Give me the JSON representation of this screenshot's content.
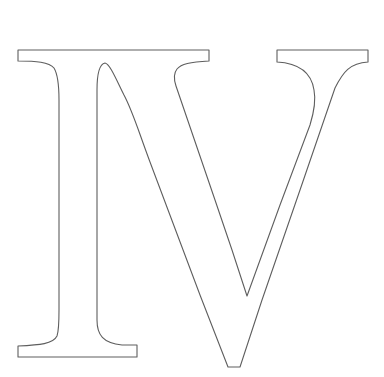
{
  "figure": {
    "text": "IV",
    "background": "#ffffff",
    "stroke_color": "#5e5e5e"
  },
  "glyphs": [
    {
      "char": "I",
      "path": "M18,50 L209,50 L209,61 C190,62 181,64 177,69 C173,74 174,80 176,86 L215,200 L232,250 L247,296 L280,205 L310,125 C314,112 316,100 314,90 C311,70 295,63 277,62 L277,50 L368,50 L368,62 C350,63 343,72 335,88 L300,190 L262,300 L240,367 L228,367 L200,295 L150,162 C138,130 133,112 124,95 C116,79 110,64 105,63 C100,64 97,72 97,90 L97,320 C97,335 103,343 122,345 L137,345 L137,357 L18,357 L18,346 C40,345 53,344 57,336 C59,330 59,322 59,310 L59,100 C59,85 57,73 54,68 C49,62 36,61 18,61 Z"
    }
  ]
}
